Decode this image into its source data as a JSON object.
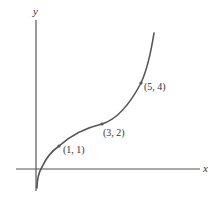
{
  "diagram": {
    "axes": {
      "x_label": "x",
      "y_label": "y"
    },
    "points": [
      {
        "label": "(1, 1)",
        "x": 1,
        "y": 1
      },
      {
        "label": "(3, 2)",
        "x": 3,
        "y": 2
      },
      {
        "label": "(5, 4)",
        "x": 5,
        "y": 4
      }
    ],
    "curve_description": "increasing curve with inflection near (3, 2); steep near x=0 and rising steeply beyond (5, 4)",
    "colors": {
      "stroke": "#555555",
      "background": "#ffffff"
    }
  }
}
